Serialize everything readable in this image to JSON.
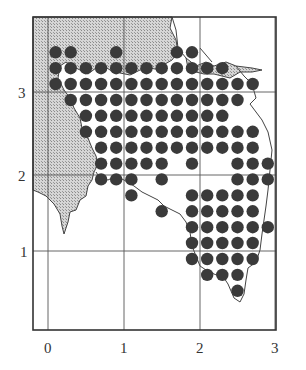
{
  "map": {
    "type": "distribution-grid-map",
    "x_ticks": [
      "0",
      "1",
      "2",
      "3"
    ],
    "y_ticks": [
      "1",
      "2",
      "3"
    ],
    "colors": {
      "land_shaded": "#c9c9c9",
      "dot": "#3a3a3a",
      "grid": "#555555",
      "frame": "#333333",
      "background": "#ffffff"
    }
  },
  "chart_data": {
    "type": "scatter",
    "title": "",
    "xlabel": "",
    "ylabel": "",
    "x_ticks": [
      0,
      1,
      2,
      3
    ],
    "y_ticks": [
      1,
      2,
      3
    ],
    "xlim": [
      -0.2,
      3.05
    ],
    "ylim": [
      -0.3,
      3.8
    ],
    "grid": true,
    "legend": null,
    "dot_rows": [
      {
        "y": 3.5,
        "x": [
          0.1,
          0.3,
          0.9,
          1.7,
          1.9
        ]
      },
      {
        "y": 3.3,
        "x": [
          0.1,
          0.3,
          0.5,
          0.7,
          0.9,
          1.1,
          1.3,
          1.5,
          1.7,
          1.9,
          2.1,
          2.3
        ]
      },
      {
        "y": 3.1,
        "x": [
          0.1,
          0.3,
          0.5,
          0.7,
          0.9,
          1.1,
          1.3,
          1.5,
          1.7,
          1.9,
          2.1,
          2.3,
          2.5,
          2.7
        ]
      },
      {
        "y": 2.9,
        "x": [
          0.3,
          0.5,
          0.7,
          0.9,
          1.1,
          1.3,
          1.5,
          1.7,
          1.9,
          2.1,
          2.3,
          2.5
        ]
      },
      {
        "y": 2.7,
        "x": [
          0.5,
          0.7,
          0.9,
          1.1,
          1.3,
          1.5,
          1.7,
          1.9,
          2.1,
          2.3
        ]
      },
      {
        "y": 2.5,
        "x": [
          0.5,
          0.7,
          0.9,
          1.1,
          1.3,
          1.5,
          1.7,
          1.9,
          2.1,
          2.3,
          2.5,
          2.7
        ]
      },
      {
        "y": 2.3,
        "x": [
          0.7,
          0.9,
          1.1,
          1.3,
          1.5,
          1.7,
          1.9,
          2.1,
          2.3,
          2.5,
          2.7
        ]
      },
      {
        "y": 2.1,
        "x": [
          0.7,
          0.9,
          1.1,
          1.3,
          1.5,
          1.9,
          2.5,
          2.7,
          2.9
        ]
      },
      {
        "y": 1.9,
        "x": [
          0.7,
          0.9,
          1.1,
          1.5,
          2.5,
          2.7,
          2.9
        ]
      },
      {
        "y": 1.7,
        "x": [
          1.1,
          1.9,
          2.1,
          2.3,
          2.5,
          2.7
        ]
      },
      {
        "y": 1.5,
        "x": [
          1.5,
          1.9,
          2.1,
          2.3,
          2.5,
          2.7
        ]
      },
      {
        "y": 1.3,
        "x": [
          1.9,
          2.1,
          2.3,
          2.5,
          2.7,
          2.9
        ]
      },
      {
        "y": 1.1,
        "x": [
          1.9,
          2.1,
          2.3,
          2.5,
          2.7
        ]
      },
      {
        "y": 0.9,
        "x": [
          1.9,
          2.1,
          2.3,
          2.5,
          2.7
        ]
      },
      {
        "y": 0.7,
        "x": [
          2.1,
          2.3,
          2.5
        ]
      },
      {
        "y": 0.5,
        "x": [
          2.5
        ]
      }
    ]
  }
}
